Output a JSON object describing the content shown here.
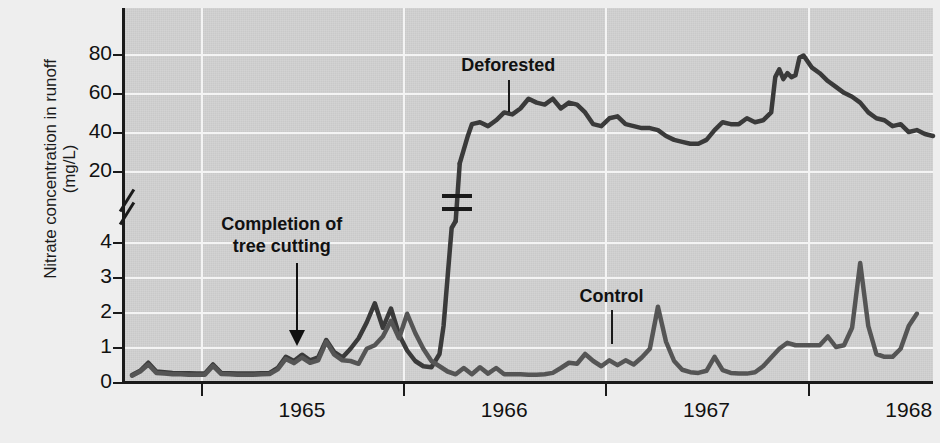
{
  "chart_data": {
    "type": "line",
    "title": "",
    "xlabel": "",
    "ylabel": "Nitrate concentration in runoff",
    "ylabel_units": "(mg/L)",
    "ylabel_line1": "Nitrate concentration in runoff",
    "ylabel_line2": "(mg/L)",
    "grid": true,
    "legend_position": "inline-labels",
    "broken_axis": true,
    "y_lower_ticks": [
      0,
      1,
      2,
      3,
      4
    ],
    "y_upper_ticks": [
      20,
      40,
      60,
      80
    ],
    "y_lower_range": [
      0,
      4.6
    ],
    "y_upper_range": [
      14,
      90
    ],
    "x_tick_labels": [
      "1965",
      "1966",
      "1967",
      "1968"
    ],
    "x_range": [
      "1964.62",
      "1968.30"
    ],
    "annotations": [
      {
        "name": "completion-of-tree-cutting",
        "line1": "Completion of",
        "line2": "tree cutting",
        "x": 1965.4,
        "points_to_y": 1.25
      },
      {
        "name": "deforested-label",
        "text": "Deforested",
        "x": 1966.52,
        "points_to_y": 42
      },
      {
        "name": "control-label",
        "text": "Control",
        "x": 1966.62,
        "points_to_y": 1.1
      }
    ],
    "series": [
      {
        "name": "Deforested",
        "color": "#3a3a3a",
        "points_lower": [
          [
            1964.66,
            0.2
          ],
          [
            1964.7,
            0.32
          ],
          [
            1964.74,
            0.55
          ],
          [
            1964.78,
            0.3
          ],
          [
            1964.82,
            0.28
          ],
          [
            1964.86,
            0.26
          ],
          [
            1964.9,
            0.25
          ],
          [
            1964.94,
            0.25
          ],
          [
            1964.98,
            0.24
          ],
          [
            1965.02,
            0.24
          ],
          [
            1965.06,
            0.5
          ],
          [
            1965.1,
            0.26
          ],
          [
            1965.14,
            0.25
          ],
          [
            1965.18,
            0.24
          ],
          [
            1965.22,
            0.24
          ],
          [
            1965.26,
            0.24
          ],
          [
            1965.3,
            0.25
          ],
          [
            1965.34,
            0.26
          ],
          [
            1965.38,
            0.4
          ],
          [
            1965.42,
            0.72
          ],
          [
            1965.46,
            0.6
          ],
          [
            1965.5,
            0.78
          ],
          [
            1965.54,
            0.62
          ],
          [
            1965.58,
            0.7
          ],
          [
            1965.62,
            1.2
          ],
          [
            1965.66,
            0.85
          ],
          [
            1965.7,
            0.7
          ],
          [
            1965.74,
            0.95
          ],
          [
            1965.78,
            1.25
          ],
          [
            1965.82,
            1.7
          ],
          [
            1965.86,
            2.25
          ],
          [
            1965.9,
            1.55
          ],
          [
            1965.94,
            2.1
          ],
          [
            1965.98,
            1.35
          ],
          [
            1966.02,
            0.9
          ],
          [
            1966.06,
            0.6
          ],
          [
            1966.1,
            0.45
          ],
          [
            1966.14,
            0.42
          ],
          [
            1966.18,
            0.8
          ],
          [
            1966.2,
            1.6
          ],
          [
            1966.22,
            3.0
          ],
          [
            1966.24,
            4.4
          ],
          [
            1966.26,
            4.6
          ]
        ],
        "points_upper": [
          [
            1966.28,
            24
          ],
          [
            1966.32,
            38
          ],
          [
            1966.34,
            44
          ],
          [
            1966.38,
            45
          ],
          [
            1966.42,
            43
          ],
          [
            1966.46,
            46
          ],
          [
            1966.5,
            50
          ],
          [
            1966.54,
            49
          ],
          [
            1966.58,
            52
          ],
          [
            1966.62,
            57
          ],
          [
            1966.66,
            55
          ],
          [
            1966.7,
            54
          ],
          [
            1966.74,
            57
          ],
          [
            1966.78,
            52
          ],
          [
            1966.82,
            55
          ],
          [
            1966.86,
            54
          ],
          [
            1966.9,
            50
          ],
          [
            1966.94,
            44
          ],
          [
            1966.98,
            43
          ],
          [
            1967.02,
            47
          ],
          [
            1967.06,
            48
          ],
          [
            1967.1,
            44
          ],
          [
            1967.14,
            43
          ],
          [
            1967.18,
            42
          ],
          [
            1967.22,
            42
          ],
          [
            1967.26,
            41
          ],
          [
            1967.3,
            38
          ],
          [
            1967.34,
            36
          ],
          [
            1967.38,
            35
          ],
          [
            1967.42,
            34
          ],
          [
            1967.46,
            34
          ],
          [
            1967.5,
            36
          ],
          [
            1967.54,
            41
          ],
          [
            1967.58,
            45
          ],
          [
            1967.62,
            44
          ],
          [
            1967.66,
            44
          ],
          [
            1967.7,
            47
          ],
          [
            1967.74,
            45
          ],
          [
            1967.78,
            46
          ],
          [
            1967.82,
            50
          ],
          [
            1967.84,
            68
          ],
          [
            1967.86,
            72
          ],
          [
            1967.88,
            67
          ],
          [
            1967.9,
            70
          ],
          [
            1967.92,
            68
          ],
          [
            1967.94,
            69
          ],
          [
            1967.96,
            78
          ],
          [
            1967.98,
            79
          ],
          [
            1968.02,
            73
          ],
          [
            1968.06,
            70
          ],
          [
            1968.1,
            66
          ],
          [
            1968.14,
            63
          ],
          [
            1968.18,
            60
          ],
          [
            1968.22,
            58
          ],
          [
            1968.26,
            55
          ],
          [
            1968.3,
            50
          ],
          [
            1968.34,
            47
          ],
          [
            1968.38,
            46
          ],
          [
            1968.42,
            43
          ],
          [
            1968.46,
            44
          ],
          [
            1968.5,
            40
          ],
          [
            1968.54,
            41
          ],
          [
            1968.58,
            39
          ],
          [
            1968.62,
            38
          ]
        ]
      },
      {
        "name": "Control",
        "color": "#555555",
        "points_lower": [
          [
            1964.66,
            0.18
          ],
          [
            1964.7,
            0.3
          ],
          [
            1964.74,
            0.5
          ],
          [
            1964.78,
            0.26
          ],
          [
            1964.82,
            0.24
          ],
          [
            1964.86,
            0.22
          ],
          [
            1964.9,
            0.22
          ],
          [
            1964.94,
            0.21
          ],
          [
            1964.98,
            0.21
          ],
          [
            1965.02,
            0.21
          ],
          [
            1965.06,
            0.46
          ],
          [
            1965.1,
            0.23
          ],
          [
            1965.14,
            0.22
          ],
          [
            1965.18,
            0.21
          ],
          [
            1965.22,
            0.21
          ],
          [
            1965.26,
            0.21
          ],
          [
            1965.3,
            0.22
          ],
          [
            1965.34,
            0.23
          ],
          [
            1965.38,
            0.36
          ],
          [
            1965.42,
            0.66
          ],
          [
            1965.46,
            0.54
          ],
          [
            1965.5,
            0.7
          ],
          [
            1965.54,
            0.55
          ],
          [
            1965.58,
            0.62
          ],
          [
            1965.62,
            1.15
          ],
          [
            1965.66,
            0.78
          ],
          [
            1965.7,
            0.62
          ],
          [
            1965.74,
            0.6
          ],
          [
            1965.78,
            0.52
          ],
          [
            1965.82,
            0.95
          ],
          [
            1965.86,
            1.05
          ],
          [
            1965.9,
            1.3
          ],
          [
            1965.94,
            1.75
          ],
          [
            1965.98,
            1.25
          ],
          [
            1966.02,
            1.95
          ],
          [
            1966.06,
            1.4
          ],
          [
            1966.1,
            0.95
          ],
          [
            1966.14,
            0.6
          ],
          [
            1966.18,
            0.45
          ],
          [
            1966.22,
            0.3
          ],
          [
            1966.26,
            0.22
          ],
          [
            1966.3,
            0.4
          ],
          [
            1966.34,
            0.22
          ],
          [
            1966.38,
            0.42
          ],
          [
            1966.42,
            0.24
          ],
          [
            1966.46,
            0.4
          ],
          [
            1966.5,
            0.22
          ],
          [
            1966.54,
            0.22
          ],
          [
            1966.58,
            0.22
          ],
          [
            1966.62,
            0.21
          ],
          [
            1966.66,
            0.21
          ],
          [
            1966.7,
            0.22
          ],
          [
            1966.74,
            0.26
          ],
          [
            1966.78,
            0.4
          ],
          [
            1966.82,
            0.55
          ],
          [
            1966.86,
            0.52
          ],
          [
            1966.9,
            0.8
          ],
          [
            1966.94,
            0.6
          ],
          [
            1966.98,
            0.45
          ],
          [
            1967.02,
            0.62
          ],
          [
            1967.06,
            0.48
          ],
          [
            1967.1,
            0.62
          ],
          [
            1967.14,
            0.5
          ],
          [
            1967.18,
            0.7
          ],
          [
            1967.22,
            0.95
          ],
          [
            1967.26,
            2.15
          ],
          [
            1967.3,
            1.15
          ],
          [
            1967.34,
            0.6
          ],
          [
            1967.38,
            0.35
          ],
          [
            1967.42,
            0.28
          ],
          [
            1967.46,
            0.26
          ],
          [
            1967.5,
            0.32
          ],
          [
            1967.54,
            0.72
          ],
          [
            1967.58,
            0.34
          ],
          [
            1967.62,
            0.26
          ],
          [
            1967.66,
            0.24
          ],
          [
            1967.7,
            0.24
          ],
          [
            1967.74,
            0.28
          ],
          [
            1967.78,
            0.45
          ],
          [
            1967.82,
            0.7
          ],
          [
            1967.86,
            0.95
          ],
          [
            1967.9,
            1.12
          ],
          [
            1967.94,
            1.05
          ],
          [
            1967.98,
            1.05
          ],
          [
            1968.02,
            1.05
          ],
          [
            1968.06,
            1.05
          ],
          [
            1968.1,
            1.3
          ],
          [
            1968.14,
            1.0
          ],
          [
            1968.18,
            1.05
          ],
          [
            1968.22,
            1.55
          ],
          [
            1968.26,
            3.4
          ],
          [
            1968.3,
            1.6
          ],
          [
            1968.34,
            0.8
          ],
          [
            1968.38,
            0.72
          ],
          [
            1968.42,
            0.72
          ],
          [
            1968.46,
            0.95
          ],
          [
            1968.5,
            1.6
          ],
          [
            1968.54,
            1.95
          ]
        ],
        "points_upper": []
      }
    ]
  }
}
